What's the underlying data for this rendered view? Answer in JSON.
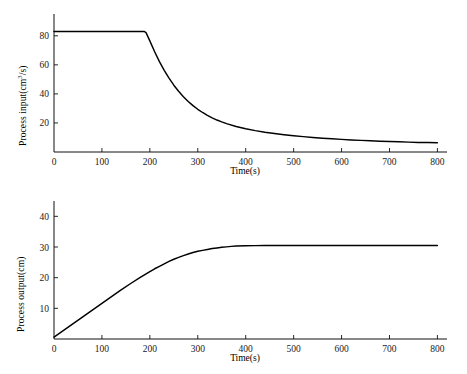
{
  "chart_data": [
    {
      "id": "process-input",
      "type": "line",
      "title": "",
      "xlabel": "Time(s)",
      "ylabel": "Process input(cm3/s)",
      "ylabel_display": "Process input(cm³/s)",
      "xlim": [
        0,
        820
      ],
      "ylim": [
        0,
        95
      ],
      "xticks": [
        0,
        100,
        200,
        300,
        400,
        500,
        600,
        700,
        800
      ],
      "xticklabels": [
        "0",
        "100",
        "200",
        "300",
        "400",
        "500",
        "600",
        "700",
        "800"
      ],
      "yticks": [
        20,
        40,
        60,
        80
      ],
      "yticklabels": [
        "20",
        "40",
        "60",
        "80"
      ],
      "grid": false,
      "legend": false,
      "line_color": "#000000",
      "series": [
        {
          "name": "Process input",
          "x": [
            0,
            20,
            40,
            60,
            80,
            100,
            120,
            140,
            160,
            180,
            188,
            192,
            200,
            210,
            220,
            230,
            240,
            250,
            260,
            270,
            280,
            290,
            300,
            310,
            320,
            330,
            340,
            350,
            360,
            380,
            400,
            420,
            440,
            460,
            480,
            500,
            520,
            540,
            560,
            580,
            600,
            620,
            640,
            660,
            680,
            700,
            720,
            740,
            760,
            780,
            800
          ],
          "y": [
            83,
            83,
            83,
            83,
            83,
            83,
            83,
            83,
            83,
            83,
            83,
            82.2,
            76.5,
            69.0,
            62.2,
            56.2,
            50.8,
            46.0,
            41.8,
            38.1,
            34.8,
            31.9,
            29.4,
            27.2,
            25.2,
            23.5,
            22.0,
            20.7,
            19.5,
            17.6,
            16.0,
            14.7,
            13.6,
            12.7,
            11.9,
            11.2,
            10.6,
            10.0,
            9.5,
            9.1,
            8.7,
            8.3,
            8.0,
            7.7,
            7.4,
            7.2,
            7.0,
            6.8,
            6.6,
            6.5,
            6.4
          ]
        }
      ]
    },
    {
      "id": "process-output",
      "type": "line",
      "title": "",
      "xlabel": "Time(s)",
      "ylabel": "Process output(cm)",
      "ylabel_display": "Process output(cm)",
      "xlim": [
        0,
        820
      ],
      "ylim": [
        0,
        45
      ],
      "xticks": [
        0,
        100,
        200,
        300,
        400,
        500,
        600,
        700,
        800
      ],
      "xticklabels": [
        "0",
        "100",
        "200",
        "300",
        "400",
        "500",
        "600",
        "700",
        "800"
      ],
      "yticks": [
        10,
        20,
        30,
        40
      ],
      "yticklabels": [
        "10",
        "20",
        "30",
        "40"
      ],
      "grid": false,
      "legend": false,
      "line_color": "#000000",
      "series": [
        {
          "name": "Process output",
          "x": [
            0,
            20,
            40,
            60,
            80,
            100,
            120,
            140,
            160,
            180,
            200,
            210,
            220,
            230,
            240,
            250,
            260,
            270,
            280,
            290,
            300,
            310,
            320,
            330,
            340,
            350,
            360,
            370,
            380,
            400,
            420,
            440,
            460,
            480,
            500,
            540,
            580,
            620,
            660,
            700,
            740,
            780,
            800
          ],
          "y": [
            0.6,
            2.8,
            5.0,
            7.2,
            9.4,
            11.6,
            13.8,
            16.0,
            18.1,
            20.1,
            22.0,
            22.9,
            23.7,
            24.5,
            25.3,
            26.0,
            26.6,
            27.2,
            27.7,
            28.2,
            28.6,
            28.9,
            29.2,
            29.5,
            29.7,
            29.9,
            30.05,
            30.2,
            30.3,
            30.4,
            30.45,
            30.5,
            30.5,
            30.5,
            30.5,
            30.5,
            30.5,
            30.5,
            30.5,
            30.5,
            30.5,
            30.5,
            30.5
          ]
        }
      ]
    }
  ]
}
